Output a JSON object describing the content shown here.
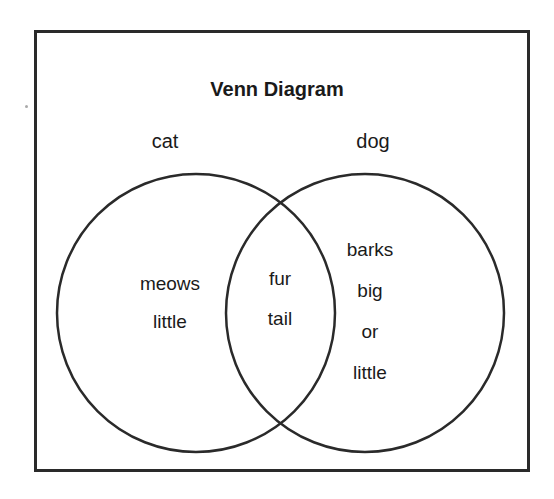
{
  "title": "Venn Diagram",
  "sets": [
    {
      "label": "cat",
      "only": [
        "meows",
        "little"
      ]
    },
    {
      "label": "dog",
      "only": [
        "barks",
        "big",
        "or",
        "little"
      ]
    }
  ],
  "intersection": [
    "fur",
    "tail"
  ],
  "colors": {
    "stroke": "#2a2a2a",
    "background": "#ffffff",
    "text": "#1a1a1a"
  }
}
